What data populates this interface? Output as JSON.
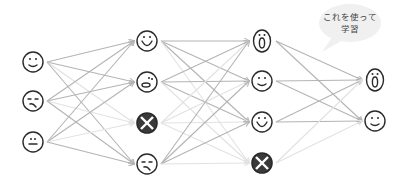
{
  "diagram": {
    "type": "neural-network-dropout",
    "colors": {
      "edge_active": "#b4b4b4",
      "edge_dropped": "#e2e2e2",
      "node_stroke": "#2a2a2a",
      "dropped_fill": "#3a3a3a",
      "bubble_fill": "#f0f0f0"
    },
    "speech_bubble": {
      "line1": "これを使って",
      "line2": "学習"
    },
    "layers": [
      {
        "name": "input",
        "x": 33,
        "nodes": [
          {
            "y": 62,
            "face": "smile",
            "dropped": false
          },
          {
            "y": 101,
            "face": "sad",
            "dropped": false
          },
          {
            "y": 142,
            "face": "neutral",
            "dropped": false
          }
        ]
      },
      {
        "name": "hidden-1",
        "x": 147,
        "nodes": [
          {
            "y": 41,
            "face": "big-smile",
            "dropped": false
          },
          {
            "y": 82,
            "face": "worried",
            "dropped": false
          },
          {
            "y": 123,
            "face": "dropped",
            "dropped": true
          },
          {
            "y": 164,
            "face": "sad",
            "dropped": false
          }
        ]
      },
      {
        "name": "hidden-2",
        "x": 262,
        "nodes": [
          {
            "y": 41,
            "face": "surprised",
            "dropped": false
          },
          {
            "y": 81,
            "face": "smile",
            "dropped": false
          },
          {
            "y": 122,
            "face": "big-smile",
            "dropped": false
          },
          {
            "y": 163,
            "face": "dropped",
            "dropped": true
          }
        ]
      },
      {
        "name": "output",
        "x": 375,
        "nodes": [
          {
            "y": 80,
            "face": "surprised",
            "dropped": false
          },
          {
            "y": 121,
            "face": "smile",
            "dropped": false
          }
        ]
      }
    ]
  }
}
